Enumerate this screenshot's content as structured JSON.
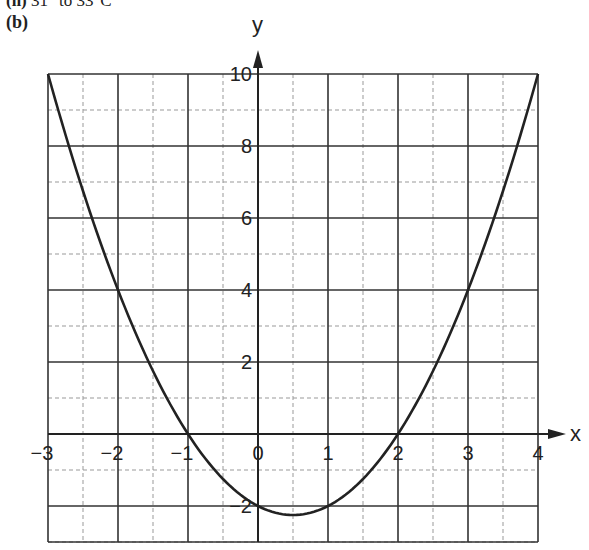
{
  "header": {
    "cut_line_prefix": "(ii)",
    "cut_line_text": "31° to 33°C",
    "part_label": "(b)"
  },
  "colors": {
    "curve": "#222222",
    "grid_major": "#333333",
    "grid_minor": "#999999",
    "background": "#ffffff"
  },
  "chart_data": {
    "type": "line",
    "title": "",
    "xlabel": "x",
    "ylabel": "y",
    "xlim": [
      -3,
      4
    ],
    "ylim": [
      -3,
      10
    ],
    "grid": true,
    "x_ticks": [
      "-3",
      "-2",
      "-1",
      "0",
      "1",
      "2",
      "3",
      "4"
    ],
    "y_ticks": [
      "-2",
      "2",
      "4",
      "6",
      "8",
      "10"
    ],
    "series": [
      {
        "name": "y = x² − x − 2",
        "x": [
          -3,
          -2.5,
          -2,
          -1.5,
          -1,
          -0.5,
          0,
          0.5,
          1,
          1.5,
          2,
          2.5,
          3,
          3.5,
          4
        ],
        "values": [
          10,
          6.75,
          4,
          1.75,
          0,
          -1.25,
          -2,
          -2.25,
          -2,
          -1.25,
          0,
          1.75,
          4,
          6.75,
          10
        ]
      }
    ]
  }
}
